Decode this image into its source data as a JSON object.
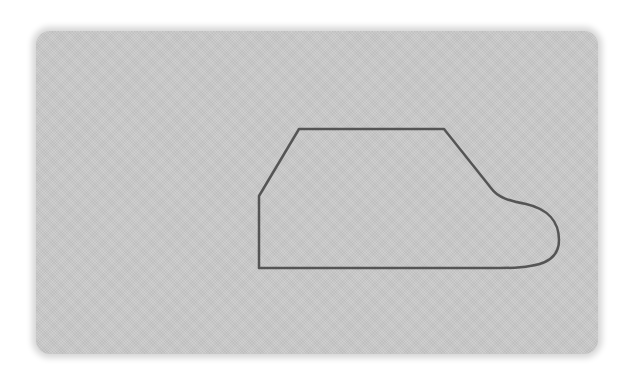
{
  "figure": {
    "background_color": "#ffffff",
    "panel": {
      "color": "#c9c9c9",
      "x": 36,
      "y": 31,
      "width": 562,
      "height": 323
    },
    "outline": {
      "stroke_color": "#555555",
      "stroke_width": 2.5,
      "points": {
        "left_bottom": [
          259,
          268
        ],
        "left_top_vertical": [
          259,
          196
        ],
        "top_left": [
          299,
          129
        ],
        "top_right": [
          444,
          129
        ],
        "slope_end": [
          492,
          190
        ],
        "bulge_right": [
          559,
          235
        ],
        "bottom_right": [
          500,
          268
        ]
      }
    }
  }
}
